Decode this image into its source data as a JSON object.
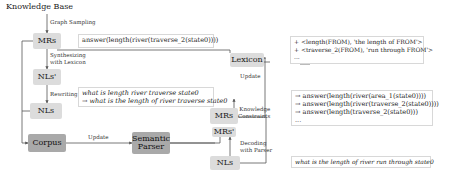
{
  "title": "Knowledge Base",
  "nodes": {
    "mrs_top": "MRs",
    "nls_prime_left": "NLs'",
    "nls_left": "NLs",
    "corpus": "Corpus",
    "parser_line1": "Semantic",
    "parser_line2": "Parser",
    "lexicon": "Lexicon",
    "mrs_right": "MRs",
    "mrs_prime_right": "MRs'",
    "nls_right": "NLs"
  },
  "edge_labels": {
    "graph_sampling": "Graph Sampling",
    "synth_line1": "Synthesizing",
    "synth_line2": "with Lexicon",
    "rewriting": "Rewriting",
    "update_corpus": "Update",
    "update_lexicon": "Update",
    "knowledge_line1": "Knowledge",
    "knowledge_line2": "Constraints",
    "decoding_line1": "Decoding",
    "decoding_line2": "with Parser"
  },
  "boxes": {
    "mr_example": "answer(length(river(traverse_2(state0))))",
    "rewrite_line1": "what is length river traverse state0",
    "rewrite_line2": "→ what is the length of river traverse state0",
    "lexicon_line1": "+ <length(FROM), 'the length of FROM'>",
    "lexicon_line2": "+ <traverse_2(FROM), 'run through FROM'>",
    "lexicon_line3": "...",
    "candidates": [
      "→ answer(length(river(area_1(state0))))",
      "→ answer(length(river(traverse_2(state0))))",
      "→ answer(length(traverse_2(state0)))",
      "..."
    ],
    "nl_query": "what is the length of river run through state0"
  },
  "colors": {
    "light_node": "#dcdcdc",
    "dark_node": "#a9a9a9",
    "line": "#555555"
  }
}
